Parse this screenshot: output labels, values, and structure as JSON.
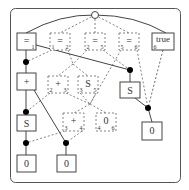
{
  "diagram": {
    "title": "",
    "nodes": [
      {
        "id": "eq1",
        "label": "=",
        "sub_left": "",
        "sub_right": "1",
        "style": "solid"
      },
      {
        "id": "eq12",
        "label": "=",
        "sub_left": "1",
        "sub_right": "2",
        "style": "dashed"
      },
      {
        "id": "eq25",
        "label": "=",
        "sub_left": "2",
        "sub_right": "5",
        "style": "dashed"
      },
      {
        "id": "eq56",
        "label": "=",
        "sub_left": "5",
        "sub_right": "6",
        "style": "dashed"
      },
      {
        "id": "true6",
        "label": "true",
        "sub_left": "6",
        "sub_right": "",
        "style": "solid"
      },
      {
        "id": "plus",
        "label": "+",
        "sub_left": "",
        "sub_right": "",
        "style": "solid"
      },
      {
        "id": "plus23",
        "label": "+",
        "sub_left": "2",
        "sub_right": "3",
        "style": "dashed"
      },
      {
        "id": "s35",
        "label": "S",
        "sub_left": "3",
        "sub_right": "5",
        "style": "dashed"
      },
      {
        "id": "s_right",
        "label": "S",
        "sub_left": "",
        "sub_right": "",
        "style": "solid"
      },
      {
        "id": "s_left",
        "label": "S",
        "sub_left": "",
        "sub_right": "",
        "style": "solid"
      },
      {
        "id": "plus34",
        "label": "+",
        "sub_left": "3",
        "sub_right": "4",
        "style": "dashed"
      },
      {
        "id": "zero46",
        "label": "0",
        "sub_left": "4",
        "sub_right": "6",
        "style": "dashed"
      },
      {
        "id": "zero_right",
        "label": "0",
        "sub_left": "",
        "sub_right": "",
        "style": "solid"
      },
      {
        "id": "zero_left",
        "label": "0",
        "sub_left": "",
        "sub_right": "",
        "style": "solid"
      },
      {
        "id": "zero_mid",
        "label": "0",
        "sub_left": "",
        "sub_right": "",
        "style": "solid"
      }
    ],
    "colors": {
      "stroke": "#555555",
      "dot": "#000000",
      "background": "#ffffff"
    }
  }
}
